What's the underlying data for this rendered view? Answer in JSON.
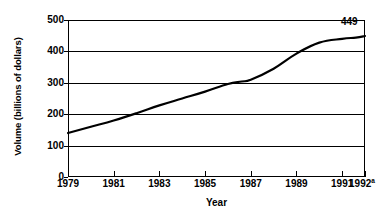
{
  "chart_data": {
    "type": "line",
    "title": "",
    "xlabel": "Year",
    "ylabel": "Volume (billions of dollars)",
    "xlim": [
      1979,
      1992
    ],
    "ylim": [
      0,
      500
    ],
    "grid": true,
    "legend": "none",
    "x_tick_labels": [
      "1979",
      "1981",
      "1983",
      "1985",
      "1987",
      "1989",
      "1991",
      "1992"
    ],
    "x_tick_values": [
      1979,
      1981,
      1983,
      1985,
      1987,
      1989,
      1991,
      1992
    ],
    "x_last_tick_footnote": "a",
    "y_tick_labels": [
      "0",
      "100",
      "200",
      "300",
      "400",
      "500"
    ],
    "y_tick_values": [
      0,
      100,
      200,
      300,
      400,
      500
    ],
    "series": [
      {
        "name": "Volume",
        "color": "#000000",
        "x": [
          1979,
          1980,
          1981,
          1982,
          1983,
          1984,
          1985,
          1986,
          1986.6,
          1987,
          1988,
          1989,
          1990,
          1991,
          1991.6,
          1992
        ],
        "values": [
          140,
          160,
          180,
          203,
          228,
          250,
          272,
          296,
          304,
          310,
          345,
          393,
          428,
          440,
          444,
          449
        ]
      }
    ],
    "annotations": [
      {
        "name": "end-value",
        "text": "449",
        "x": 1992,
        "y": 449
      }
    ]
  }
}
